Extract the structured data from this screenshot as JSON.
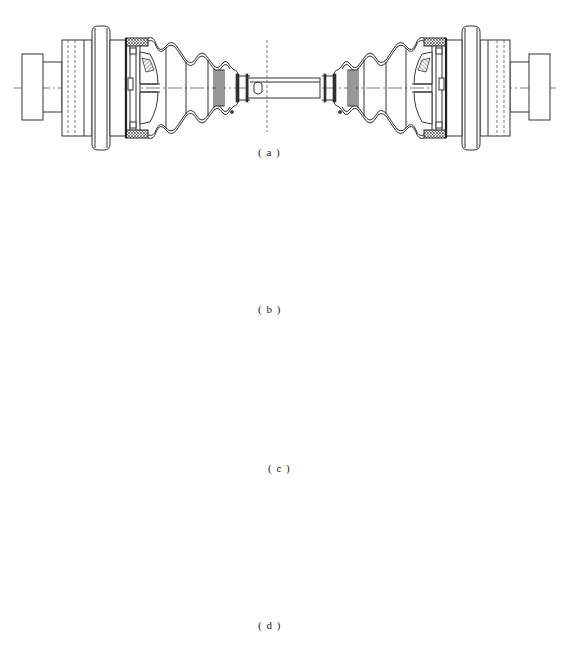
{
  "figure": {
    "subfigures": [
      {
        "id": "a",
        "label": "( a )",
        "content": "Two joint housings with bellows boots connected by central shaft"
      },
      {
        "id": "b",
        "label": "( b )",
        "content": "Shaft separated at center into two halves"
      },
      {
        "id": "c",
        "label": "( c )",
        "content": "Housing separated from boot and inner joint"
      },
      {
        "id": "d",
        "label": "( d )",
        "content": "Housing, inner joint with shaft, and boot with retaining ring separated"
      }
    ]
  },
  "colors": {
    "line": "#333333",
    "background": "#ffffff"
  }
}
